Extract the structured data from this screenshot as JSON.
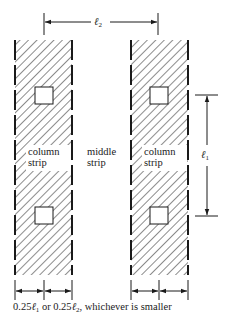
{
  "diagram": {
    "dimension_top": {
      "symbol": "ℓ",
      "subscript": "2"
    },
    "dimension_right": {
      "symbol": "ℓ",
      "subscript": "1"
    },
    "left_strip_label": {
      "line1": "column",
      "line2": "strip"
    },
    "middle_label": {
      "line1": "middle",
      "line2": "strip"
    },
    "right_strip_label": {
      "line1": "column",
      "line2": "strip"
    },
    "caption": {
      "part1": "0.25",
      "sym1": "ℓ",
      "sub1": "1",
      "part2": " or 0.25",
      "sym2": "ℓ",
      "sub2": "2",
      "part3": ", whichever is smaller"
    },
    "colors": {
      "line": "#1a1a1a",
      "background": "#ffffff"
    }
  }
}
